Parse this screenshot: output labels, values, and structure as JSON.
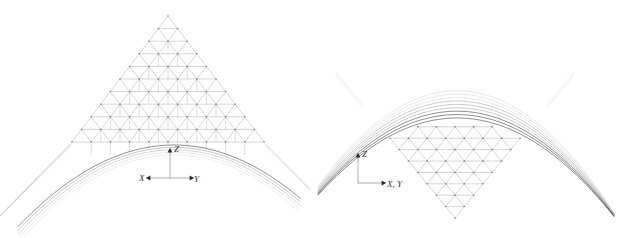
{
  "figure": {
    "background_color": "#fefefe",
    "line_color_mesh": "#9a9a9a",
    "line_color_curve": "#5a5a5a",
    "line_color_dark": "#2b2b2b",
    "axis_color": "#2b2b2b",
    "panels": [
      {
        "name": "elevation-view-arch",
        "description": "Triangular lattice shell seen in elevation, arch-shaped lower boundary with peaked apex",
        "apex": {
          "x": 168,
          "y": 16
        },
        "mesh_rows": 10,
        "axes": {
          "origin": {
            "x": 170,
            "y": 178
          },
          "z_label": "Z",
          "x_label": "X",
          "y_label": "Y",
          "z_direction": "up",
          "x_direction": "left",
          "y_direction": "right"
        }
      },
      {
        "name": "section-view-funnel",
        "description": "Inverted triangular lattice funnel with family of catenary curves across the top",
        "apex": {
          "x": 455,
          "y": 218
        },
        "mesh_rows": 10,
        "curve_count": 9,
        "axes": {
          "origin": {
            "x": 358,
            "y": 183
          },
          "z_label": "Z",
          "xy_label": "X, Y",
          "z_direction": "up",
          "xy_direction": "right"
        }
      }
    ]
  }
}
